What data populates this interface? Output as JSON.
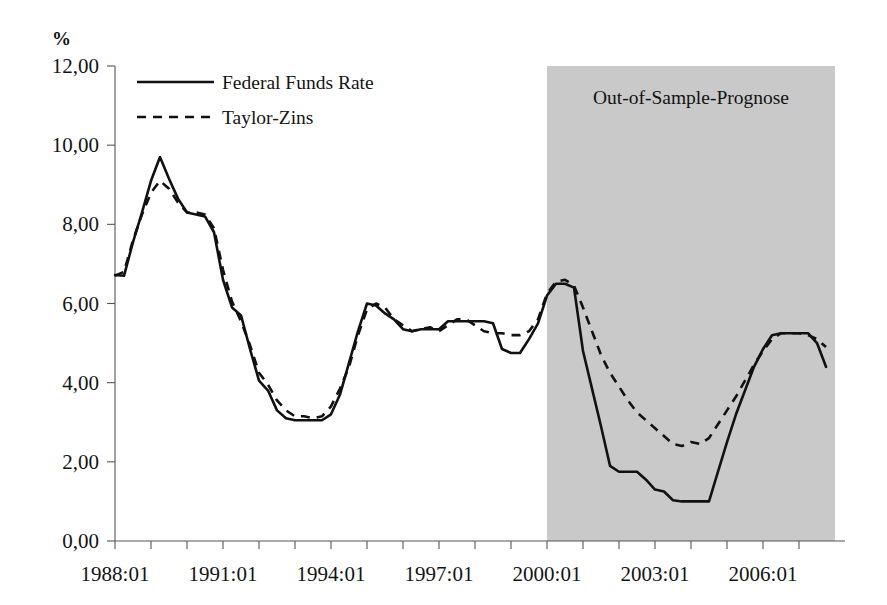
{
  "chart_data": {
    "type": "line",
    "title": "",
    "subtitle": "",
    "xlabel": "",
    "ylabel": "%",
    "ylim": [
      0,
      12
    ],
    "ytick_labels": [
      "0,00",
      "2,00",
      "4,00",
      "6,00",
      "8,00",
      "10,00",
      "12,00"
    ],
    "ytick_values": [
      0,
      2,
      4,
      6,
      8,
      10,
      12
    ],
    "xtick_labels": [
      "1988:01",
      "1991:01",
      "1994:01",
      "1997:01",
      "2000:01",
      "2003:01",
      "2006:01"
    ],
    "xtick_values": [
      "1988Q1",
      "1991Q1",
      "1994Q1",
      "1997Q1",
      "2000Q1",
      "2003Q1",
      "2006Q1"
    ],
    "x_start": "1988:01",
    "x_end": "2007:04",
    "grid": false,
    "legend_position": "top-left",
    "x": [
      "1988:01",
      "1988:02",
      "1988:03",
      "1988:04",
      "1989:01",
      "1989:02",
      "1989:03",
      "1989:04",
      "1990:01",
      "1990:02",
      "1990:03",
      "1990:04",
      "1991:01",
      "1991:02",
      "1991:03",
      "1991:04",
      "1992:01",
      "1992:02",
      "1992:03",
      "1992:04",
      "1993:01",
      "1993:02",
      "1993:03",
      "1993:04",
      "1994:01",
      "1994:02",
      "1994:03",
      "1994:04",
      "1995:01",
      "1995:02",
      "1995:03",
      "1995:04",
      "1996:01",
      "1996:02",
      "1996:03",
      "1996:04",
      "1997:01",
      "1997:02",
      "1997:03",
      "1997:04",
      "1998:01",
      "1998:02",
      "1998:03",
      "1998:04",
      "1999:01",
      "1999:02",
      "1999:03",
      "1999:04",
      "2000:01",
      "2000:02",
      "2000:03",
      "2000:04",
      "2001:01",
      "2001:02",
      "2001:03",
      "2001:04",
      "2002:01",
      "2002:02",
      "2002:03",
      "2002:04",
      "2003:01",
      "2003:02",
      "2003:03",
      "2003:04",
      "2004:01",
      "2004:02",
      "2004:03",
      "2004:04",
      "2005:01",
      "2005:02",
      "2005:03",
      "2005:04",
      "2006:01",
      "2006:02",
      "2006:03",
      "2006:04",
      "2007:01",
      "2007:02",
      "2007:03",
      "2007:04"
    ],
    "series": [
      {
        "name": "Federal Funds Rate",
        "style": "solid",
        "color": "#111111",
        "values": [
          6.72,
          6.7,
          7.55,
          8.3,
          9.1,
          9.7,
          9.15,
          8.65,
          8.3,
          8.25,
          8.2,
          7.8,
          6.6,
          5.9,
          5.7,
          4.85,
          4.05,
          3.8,
          3.3,
          3.1,
          3.05,
          3.05,
          3.05,
          3.05,
          3.2,
          3.7,
          4.5,
          5.3,
          6.0,
          5.95,
          5.75,
          5.6,
          5.35,
          5.3,
          5.35,
          5.35,
          5.35,
          5.55,
          5.55,
          5.55,
          5.55,
          5.55,
          5.5,
          4.85,
          4.75,
          4.75,
          5.1,
          5.5,
          6.2,
          6.5,
          6.5,
          6.4,
          4.8,
          3.85,
          2.9,
          1.9,
          1.75,
          1.75,
          1.75,
          1.55,
          1.3,
          1.25,
          1.03,
          1.0,
          1.0,
          1.0,
          1.0,
          1.75,
          2.5,
          3.2,
          3.8,
          4.4,
          4.85,
          5.2,
          5.25,
          5.25,
          5.25,
          5.25,
          5.0,
          4.4
        ]
      },
      {
        "name": "Taylor-Zins",
        "style": "dashed",
        "color": "#111111",
        "values": [
          6.7,
          6.8,
          7.6,
          8.25,
          8.8,
          9.1,
          8.9,
          8.55,
          8.3,
          8.3,
          8.25,
          7.9,
          6.85,
          6.05,
          5.55,
          4.95,
          4.25,
          3.95,
          3.55,
          3.3,
          3.15,
          3.15,
          3.1,
          3.15,
          3.4,
          3.85,
          4.4,
          5.2,
          5.85,
          6.0,
          5.9,
          5.6,
          5.45,
          5.3,
          5.35,
          5.4,
          5.3,
          5.45,
          5.6,
          5.6,
          5.45,
          5.3,
          5.25,
          5.25,
          5.2,
          5.2,
          5.3,
          5.6,
          6.25,
          6.55,
          6.6,
          6.45,
          5.9,
          5.3,
          4.7,
          4.25,
          3.9,
          3.55,
          3.25,
          3.05,
          2.85,
          2.65,
          2.45,
          2.4,
          2.5,
          2.45,
          2.6,
          2.95,
          3.3,
          3.65,
          4.05,
          4.45,
          4.8,
          5.1,
          5.25,
          5.25,
          5.25,
          5.2,
          5.1,
          4.9
        ]
      }
    ],
    "annotations": [
      {
        "text": "Out-of-Sample-Prognose",
        "x_start": "2000:01",
        "x_end": "2007:04",
        "kind": "shaded-region",
        "shade_color": "#c9c9c9"
      }
    ]
  },
  "legend": {
    "items": [
      {
        "label": "Federal Funds Rate",
        "style": "solid"
      },
      {
        "label": "Taylor-Zins",
        "style": "dashed"
      }
    ]
  },
  "axis": {
    "y_unit_label": "%"
  }
}
